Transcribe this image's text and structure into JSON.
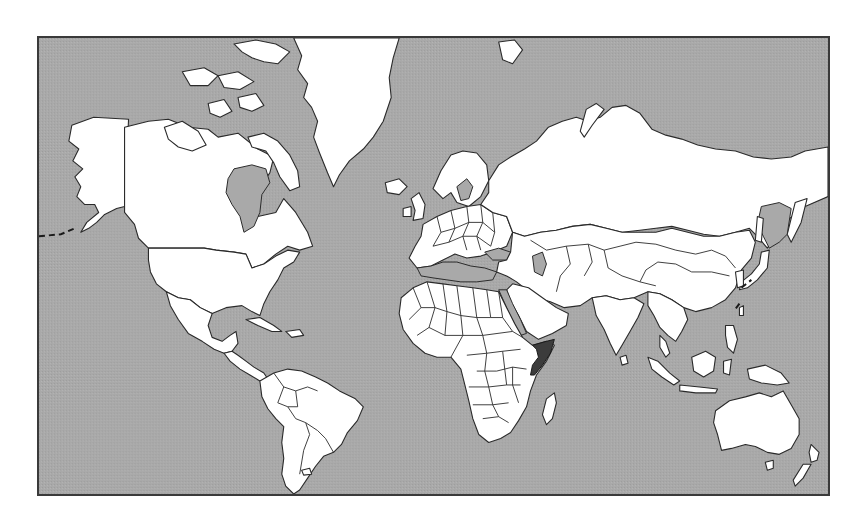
{
  "map": {
    "type": "world-map",
    "projection": "Mercator",
    "highlighted_region": "Somalia",
    "colors": {
      "ocean": "#a9a9a9",
      "land": "#ffffff",
      "border": "#2a2a2a",
      "highlight": "#3c3c3c",
      "frame": "#3a3a3a"
    },
    "frame": {
      "x": 37,
      "y": 36,
      "width": 793,
      "height": 460
    }
  }
}
